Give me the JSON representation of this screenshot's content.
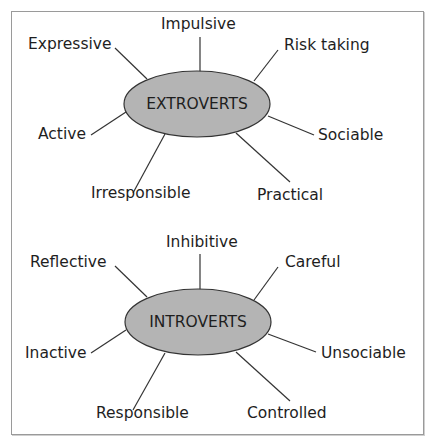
{
  "colors": {
    "ellipse_fill": "#b4b4b4",
    "ellipse_stroke": "#333333",
    "line": "#333333",
    "frame": "#9a9a9a",
    "text": "#1e1e1e"
  },
  "diagrams": [
    {
      "center_label": "EXTROVERTS",
      "traits": [
        {
          "label": "Impulsive",
          "position": "top"
        },
        {
          "label": "Risk taking",
          "position": "top-right"
        },
        {
          "label": "Sociable",
          "position": "right"
        },
        {
          "label": "Practical",
          "position": "bottom-right"
        },
        {
          "label": "Irresponsible",
          "position": "bottom-left"
        },
        {
          "label": "Active",
          "position": "left"
        },
        {
          "label": "Expressive",
          "position": "top-left"
        }
      ]
    },
    {
      "center_label": "INTROVERTS",
      "traits": [
        {
          "label": "Inhibitive",
          "position": "top"
        },
        {
          "label": "Careful",
          "position": "top-right"
        },
        {
          "label": "Unsociable",
          "position": "right"
        },
        {
          "label": "Controlled",
          "position": "bottom-right"
        },
        {
          "label": "Responsible",
          "position": "bottom-left"
        },
        {
          "label": "Inactive",
          "position": "left"
        },
        {
          "label": "Reflective",
          "position": "top-left"
        }
      ]
    }
  ]
}
